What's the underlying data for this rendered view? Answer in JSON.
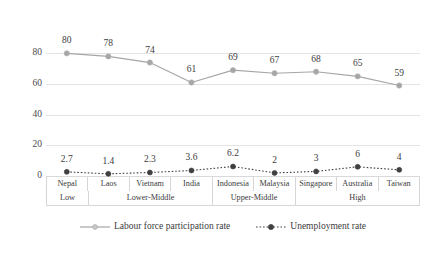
{
  "chart_data": {
    "type": "line",
    "title": "",
    "xlabel": "",
    "ylabel": "",
    "ylim": [
      0,
      90
    ],
    "yticks": [
      0,
      20,
      40,
      60,
      80
    ],
    "grid": true,
    "legend_position": "bottom",
    "categories": [
      "Nepal",
      "Laos",
      "Vietnam",
      "India",
      "Indonesia",
      "Malaysia",
      "Singapore",
      "Australia",
      "Taiwan"
    ],
    "groups": [
      {
        "label": "Low",
        "span": 1
      },
      {
        "label": "Lower-Middle",
        "span": 3
      },
      {
        "label": "Upper-Middle",
        "span": 2
      },
      {
        "label": "High",
        "span": 3
      }
    ],
    "series": [
      {
        "name": "Labour force participation rate",
        "values": [
          80,
          78,
          74,
          61,
          69,
          67,
          68,
          65,
          59
        ],
        "labels": [
          "80",
          "78",
          "74",
          "61",
          "69",
          "67",
          "68",
          "65",
          "59"
        ],
        "color": "#a6a6a6",
        "line_style": "solid",
        "marker": "circle-filled-light"
      },
      {
        "name": "Unemployment rate",
        "values": [
          2.7,
          1.4,
          2.3,
          3.6,
          6.2,
          2,
          3,
          6,
          4
        ],
        "labels": [
          "2.7",
          "1.4",
          "2.3",
          "3.6",
          "6.2",
          "2",
          "3",
          "6",
          "4"
        ],
        "color": "#404040",
        "line_style": "dotted",
        "marker": "circle-filled-dark"
      }
    ]
  },
  "legend": {
    "items": [
      {
        "label": "Labour force participation rate",
        "icon": "line-marker-light-icon"
      },
      {
        "label": "Unemployment rate",
        "icon": "line-marker-dark-icon"
      }
    ]
  },
  "colors": {
    "lfp": "#a6a6a6",
    "unemployment": "#404040",
    "grid": "#e4e4e4",
    "text": "#3c3c3c",
    "border": "#d6d6d6",
    "background": "#ffffff"
  }
}
